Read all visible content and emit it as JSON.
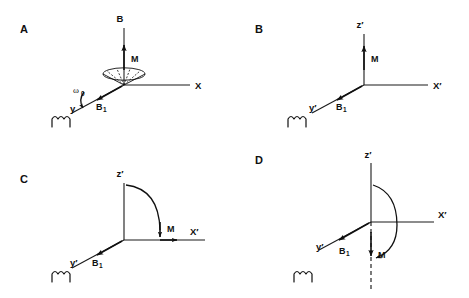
{
  "figure": {
    "background_color": "#ffffff",
    "ink_color": "#101010",
    "width": 469,
    "height": 298
  },
  "panels": [
    {
      "id": "A",
      "letter": "A",
      "frame": "laboratory",
      "axes": [
        {
          "name": "x-axis",
          "label": "X"
        },
        {
          "name": "y-axis",
          "label": "y"
        },
        {
          "name": "b-axis",
          "label": "B"
        }
      ],
      "vectors": [
        {
          "name": "magnetization",
          "label": "M",
          "direction": "up-along-B"
        },
        {
          "name": "rf-field",
          "label": "B",
          "sub": "1",
          "direction": "along-y"
        }
      ],
      "annotations": [
        {
          "name": "precession-frequency",
          "label": "ω",
          "sub": "0"
        }
      ],
      "coil": {
        "name": "rf-coil",
        "turns": 3
      },
      "precession_cone": {
        "visible": true,
        "radial_lines": 4
      }
    },
    {
      "id": "B",
      "letter": "B",
      "frame": "rotating",
      "axes": [
        {
          "name": "x-prime-axis",
          "label": "X′"
        },
        {
          "name": "y-prime-axis",
          "label": "y′"
        },
        {
          "name": "z-prime-axis",
          "label": "z′"
        }
      ],
      "vectors": [
        {
          "name": "magnetization",
          "label": "M",
          "direction": "along-z-prime"
        },
        {
          "name": "rf-field",
          "label": "B",
          "sub": "1",
          "direction": "along-y-prime"
        }
      ],
      "annotations": [],
      "coil": {
        "name": "rf-coil",
        "turns": 3
      },
      "precession_cone": {
        "visible": false
      }
    },
    {
      "id": "C",
      "letter": "C",
      "frame": "rotating",
      "axes": [
        {
          "name": "x-prime-axis",
          "label": "X′"
        },
        {
          "name": "y-prime-axis",
          "label": "y′"
        },
        {
          "name": "z-prime-axis",
          "label": "z′"
        }
      ],
      "vectors": [
        {
          "name": "magnetization",
          "label": "M",
          "direction": "tipped-90-to-x-prime"
        },
        {
          "name": "rf-field",
          "label": "B",
          "sub": "1",
          "direction": "along-y-prime"
        }
      ],
      "annotations": [
        {
          "name": "flip-arc",
          "label": "",
          "sweep_degrees": 90
        }
      ],
      "coil": {
        "name": "rf-coil",
        "turns": 3
      },
      "precession_cone": {
        "visible": false
      }
    },
    {
      "id": "D",
      "letter": "D",
      "frame": "rotating",
      "axes": [
        {
          "name": "x-prime-axis",
          "label": "X′"
        },
        {
          "name": "y-prime-axis",
          "label": "y′"
        },
        {
          "name": "z-prime-axis",
          "label": "z′"
        }
      ],
      "vectors": [
        {
          "name": "magnetization",
          "label": "M",
          "direction": "inverted-negative-z-prime"
        },
        {
          "name": "rf-field",
          "label": "B",
          "sub": "1",
          "direction": "along-y-prime"
        }
      ],
      "annotations": [
        {
          "name": "flip-arc",
          "label": "",
          "sweep_degrees": 180
        },
        {
          "name": "negative-z-dashed",
          "label": ""
        }
      ],
      "coil": {
        "name": "rf-coil",
        "turns": 3
      },
      "precession_cone": {
        "visible": false
      }
    }
  ],
  "labels": {
    "letter_a": "A",
    "letter_b": "B",
    "letter_c": "C",
    "letter_d": "D",
    "axis_X": "X",
    "axis_y": "y",
    "axis_B": "B",
    "axis_Xprime": "X′",
    "axis_yprime": "y′",
    "axis_zprime": "z′",
    "vec_M": "M",
    "vec_B": "B",
    "sub_1": "1",
    "omega": "ω",
    "sub_0": "0"
  }
}
